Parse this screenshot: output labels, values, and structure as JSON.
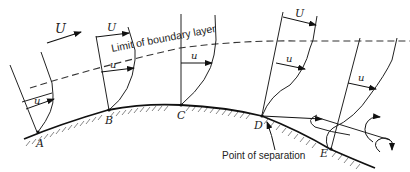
{
  "figure": {
    "type": "boundary layer separation diagram",
    "free_stream_label": "U",
    "boundary_layer_label": "Limit of boundary layer",
    "separation_label": "Point of separation",
    "velocity_labels": {
      "outer": "U",
      "inner": "u"
    },
    "stations": [
      {
        "id": "A",
        "label": "A"
      },
      {
        "id": "B",
        "label": "B"
      },
      {
        "id": "C",
        "label": "C"
      },
      {
        "id": "D",
        "label": "D"
      },
      {
        "id": "E",
        "label": "E"
      }
    ],
    "colors": {
      "line": "#222222",
      "background": "#ffffff"
    }
  }
}
